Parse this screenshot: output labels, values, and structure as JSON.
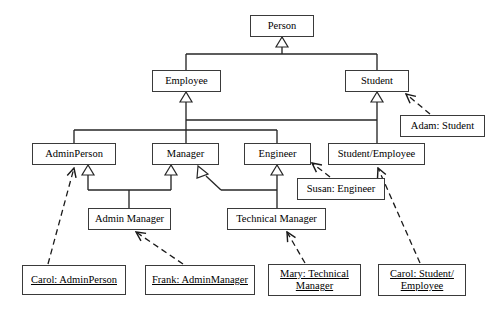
{
  "diagram": {
    "type": "uml-class-diagram",
    "background_color": "#ffffff",
    "line_color": "#262626",
    "text_color": "#000000",
    "classes": [
      {
        "id": "person",
        "label": "Person",
        "x": 250,
        "y": 15,
        "w": 64,
        "h": 22,
        "kind": "class"
      },
      {
        "id": "employee",
        "label": "Employee",
        "x": 152,
        "y": 70,
        "w": 69,
        "h": 22,
        "kind": "class"
      },
      {
        "id": "student",
        "label": "Student",
        "x": 345,
        "y": 70,
        "w": 64,
        "h": 22,
        "kind": "class"
      },
      {
        "id": "adminperson",
        "label": "AdminPerson",
        "x": 32,
        "y": 143,
        "w": 84,
        "h": 22,
        "kind": "class"
      },
      {
        "id": "manager",
        "label": "Manager",
        "x": 152,
        "y": 143,
        "w": 67,
        "h": 22,
        "kind": "class"
      },
      {
        "id": "engineer",
        "label": "Engineer",
        "x": 244,
        "y": 143,
        "w": 67,
        "h": 22,
        "kind": "class"
      },
      {
        "id": "studentemployee",
        "label": "Student/Employee",
        "x": 328,
        "y": 143,
        "w": 97,
        "h": 22,
        "kind": "class"
      },
      {
        "id": "adminmanager",
        "label": "Admin Manager",
        "x": 88,
        "y": 208,
        "w": 83,
        "h": 22,
        "kind": "class"
      },
      {
        "id": "technicalmanager",
        "label": "Technical Manager",
        "x": 227,
        "y": 208,
        "w": 99,
        "h": 22,
        "kind": "class"
      }
    ],
    "objects": [
      {
        "id": "adam",
        "label": "Adam: Student",
        "x": 400,
        "y": 115,
        "w": 85,
        "h": 22,
        "kind": "object",
        "underlined": false
      },
      {
        "id": "susan",
        "label": "Susan: Engineer",
        "x": 297,
        "y": 178,
        "w": 88,
        "h": 22,
        "kind": "object",
        "underlined": false
      },
      {
        "id": "carolAdmin",
        "label": "Carol: AdminPerson",
        "x": 22,
        "y": 265,
        "w": 104,
        "h": 30,
        "kind": "object",
        "underlined": true
      },
      {
        "id": "frank",
        "label": "Frank: AdminManager",
        "x": 145,
        "y": 265,
        "w": 110,
        "h": 30,
        "kind": "object",
        "underlined": true
      },
      {
        "id": "mary",
        "label": "Mary: Technical\nManager",
        "x": 268,
        "y": 264,
        "w": 93,
        "h": 32,
        "kind": "object",
        "underlined": true
      },
      {
        "id": "carolStudent",
        "label": "Carol: Student/\nEmployee",
        "x": 378,
        "y": 264,
        "w": 88,
        "h": 32,
        "kind": "object",
        "underlined": true
      }
    ],
    "generalizations": [
      {
        "from": "employee",
        "to": "person",
        "style": "solid",
        "arrow": "hollow-triangle"
      },
      {
        "from": "student",
        "to": "person",
        "style": "solid",
        "arrow": "hollow-triangle"
      },
      {
        "from": "adminperson",
        "to": "employee",
        "style": "solid",
        "arrow": "hollow-triangle"
      },
      {
        "from": "manager",
        "to": "employee",
        "style": "solid",
        "arrow": "hollow-triangle"
      },
      {
        "from": "engineer",
        "to": "employee",
        "style": "solid",
        "arrow": "hollow-triangle"
      },
      {
        "from": "studentemployee",
        "to": "employee",
        "style": "solid",
        "arrow": "hollow-triangle"
      },
      {
        "from": "studentemployee",
        "to": "student",
        "style": "solid",
        "arrow": "hollow-triangle"
      },
      {
        "from": "adminmanager",
        "to": "adminperson",
        "style": "solid",
        "arrow": "hollow-triangle"
      },
      {
        "from": "adminmanager",
        "to": "manager",
        "style": "solid",
        "arrow": "hollow-triangle"
      },
      {
        "from": "technicalmanager",
        "to": "manager",
        "style": "solid",
        "arrow": "hollow-triangle"
      },
      {
        "from": "technicalmanager",
        "to": "engineer",
        "style": "solid",
        "arrow": "hollow-triangle"
      }
    ],
    "instance_links": [
      {
        "from": "adam",
        "to": "student",
        "style": "dashed",
        "arrow": "open"
      },
      {
        "from": "susan",
        "to": "engineer",
        "style": "dashed",
        "arrow": "open"
      },
      {
        "from": "carolAdmin",
        "to": "adminperson",
        "style": "dashed",
        "arrow": "open"
      },
      {
        "from": "frank",
        "to": "adminmanager",
        "style": "dashed",
        "arrow": "open"
      },
      {
        "from": "mary",
        "to": "technicalmanager",
        "style": "dashed",
        "arrow": "open"
      },
      {
        "from": "carolStudent",
        "to": "studentemployee",
        "style": "dashed",
        "arrow": "open"
      }
    ]
  }
}
